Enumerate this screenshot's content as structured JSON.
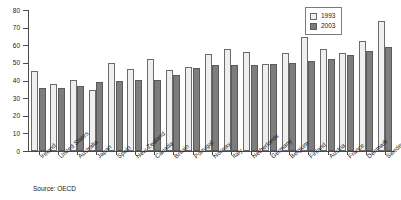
{
  "chart_data": {
    "type": "bar",
    "title": "",
    "subtitle": "",
    "xlabel": "",
    "ylabel": "",
    "ylim": [
      0,
      80
    ],
    "ytick_step": 10,
    "yticks": [
      "0",
      "10",
      "20",
      "30",
      "40",
      "50",
      "60",
      "70",
      "80"
    ],
    "grid": false,
    "legend_position": "top-right",
    "categories": [
      "Ireland",
      "United States",
      "Australia",
      "Japan",
      "Spain",
      "New Zealand",
      "Canada",
      "Britain",
      "Portugal",
      "Norway",
      "Italy",
      "Netherlands",
      "Germany",
      "Belgium",
      "Finland",
      "Austria",
      "France",
      "Denmark",
      "Sweden"
    ],
    "series": [
      {
        "name": "1993",
        "color": "#efefef",
        "values": [
          45.3,
          37.8,
          40.3,
          34.8,
          49.7,
          46.4,
          52.2,
          45.9,
          47.9,
          54.8,
          58.0,
          56.3,
          49.2,
          55.8,
          64.5,
          58.0,
          55.4,
          62.2,
          73.5
        ]
      },
      {
        "name": "2003",
        "color": "#7d7d7d",
        "values": [
          35.6,
          35.7,
          36.8,
          38.9,
          39.8,
          40.2,
          40.2,
          43.3,
          47.0,
          48.8,
          48.9,
          48.8,
          49.2,
          50.2,
          51.2,
          52.0,
          54.5,
          57.0,
          59.2
        ]
      }
    ],
    "annotations": {
      "source": "Source: OECD"
    }
  },
  "legend": {
    "items": [
      {
        "label": "1993"
      },
      {
        "label": "2003"
      }
    ]
  },
  "footer": {
    "source": "Source: OECD"
  }
}
